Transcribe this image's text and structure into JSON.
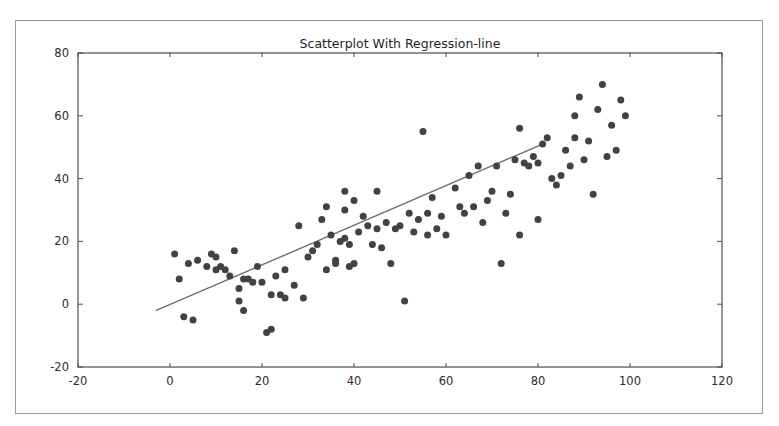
{
  "figure": {
    "background_color": "#ffffff",
    "frame_color": "#9a9a9a",
    "axes_color": "#4d4d4d"
  },
  "chart_data": {
    "type": "scatter",
    "title": "Scatterplot With Regression-line",
    "xlabel": "",
    "ylabel": "",
    "xlim": [
      -20,
      120
    ],
    "ylim": [
      -20,
      80
    ],
    "xticks": [
      -20,
      0,
      20,
      40,
      60,
      80,
      100,
      120
    ],
    "yticks": [
      -20,
      0,
      20,
      40,
      60,
      80
    ],
    "xtick_labels": [
      "-20",
      "0",
      "20",
      "40",
      "60",
      "80",
      "100",
      "120"
    ],
    "ytick_labels": [
      "-20",
      "0",
      "20",
      "40",
      "60",
      "80"
    ],
    "grid": false,
    "legend": null,
    "marker_color": "#424242",
    "marker_size": 7,
    "line_color": "#6e6e6e",
    "line_width": 1.4,
    "regression_line": {
      "x": [
        -3,
        81
      ],
      "y": [
        -2,
        51
      ],
      "slope": 0.63,
      "intercept": -0.1
    },
    "points": [
      [
        1,
        16
      ],
      [
        2,
        8
      ],
      [
        3,
        -4
      ],
      [
        4,
        13
      ],
      [
        5,
        -5
      ],
      [
        6,
        14
      ],
      [
        8,
        12
      ],
      [
        9,
        16
      ],
      [
        10,
        11
      ],
      [
        10,
        15
      ],
      [
        11,
        12
      ],
      [
        12,
        11
      ],
      [
        13,
        9
      ],
      [
        14,
        17
      ],
      [
        15,
        1
      ],
      [
        15,
        5
      ],
      [
        16,
        8
      ],
      [
        16,
        -2
      ],
      [
        17,
        8
      ],
      [
        18,
        7
      ],
      [
        19,
        12
      ],
      [
        20,
        7
      ],
      [
        21,
        -9
      ],
      [
        22,
        -8
      ],
      [
        22,
        3
      ],
      [
        23,
        9
      ],
      [
        24,
        3
      ],
      [
        25,
        11
      ],
      [
        25,
        2
      ],
      [
        27,
        6
      ],
      [
        28,
        25
      ],
      [
        29,
        2
      ],
      [
        30,
        15
      ],
      [
        31,
        17
      ],
      [
        32,
        19
      ],
      [
        33,
        27
      ],
      [
        34,
        11
      ],
      [
        34,
        31
      ],
      [
        35,
        22
      ],
      [
        36,
        14
      ],
      [
        36,
        13
      ],
      [
        37,
        20
      ],
      [
        38,
        21
      ],
      [
        38,
        30
      ],
      [
        38,
        36
      ],
      [
        39,
        19
      ],
      [
        39,
        12
      ],
      [
        40,
        13
      ],
      [
        40,
        33
      ],
      [
        41,
        23
      ],
      [
        42,
        28
      ],
      [
        43,
        25
      ],
      [
        44,
        19
      ],
      [
        45,
        24
      ],
      [
        45,
        36
      ],
      [
        46,
        18
      ],
      [
        47,
        26
      ],
      [
        48,
        13
      ],
      [
        49,
        24
      ],
      [
        50,
        25
      ],
      [
        51,
        1
      ],
      [
        52,
        29
      ],
      [
        53,
        23
      ],
      [
        54,
        27
      ],
      [
        55,
        55
      ],
      [
        56,
        29
      ],
      [
        56,
        22
      ],
      [
        57,
        34
      ],
      [
        58,
        24
      ],
      [
        59,
        28
      ],
      [
        60,
        22
      ],
      [
        62,
        37
      ],
      [
        63,
        31
      ],
      [
        64,
        29
      ],
      [
        65,
        41
      ],
      [
        66,
        31
      ],
      [
        67,
        44
      ],
      [
        68,
        26
      ],
      [
        69,
        33
      ],
      [
        70,
        36
      ],
      [
        71,
        44
      ],
      [
        72,
        13
      ],
      [
        73,
        29
      ],
      [
        74,
        35
      ],
      [
        75,
        46
      ],
      [
        76,
        22
      ],
      [
        76,
        56
      ],
      [
        77,
        45
      ],
      [
        78,
        44
      ],
      [
        79,
        47
      ],
      [
        80,
        45
      ],
      [
        80,
        27
      ],
      [
        81,
        51
      ],
      [
        82,
        53
      ],
      [
        83,
        40
      ],
      [
        84,
        38
      ],
      [
        85,
        41
      ],
      [
        86,
        49
      ],
      [
        87,
        44
      ],
      [
        88,
        60
      ],
      [
        88,
        53
      ],
      [
        89,
        66
      ],
      [
        90,
        46
      ],
      [
        91,
        52
      ],
      [
        92,
        35
      ],
      [
        93,
        62
      ],
      [
        94,
        70
      ],
      [
        95,
        47
      ],
      [
        96,
        57
      ],
      [
        97,
        49
      ],
      [
        98,
        65
      ],
      [
        99,
        60
      ]
    ]
  }
}
